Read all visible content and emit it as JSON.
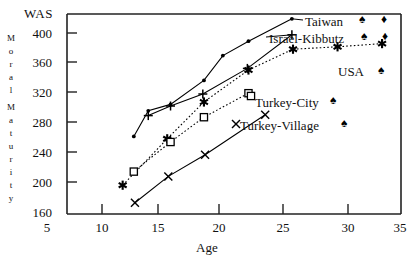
{
  "chart_data": {
    "type": "line",
    "title": "",
    "subtitle": "",
    "xlabel": "Age",
    "ylabel": "Moral Maturity",
    "ylabel_chars": [
      "M",
      "o",
      "r",
      "a",
      "l",
      "M",
      "a",
      "t",
      "u",
      "r",
      "i",
      "t",
      "y"
    ],
    "y_unit_label": "WAS",
    "xlim": [
      5,
      35
    ],
    "ylim": [
      160,
      410
    ],
    "xticks": [
      5,
      10,
      15,
      20,
      25,
      30,
      35
    ],
    "yticks": [
      160,
      200,
      240,
      280,
      320,
      360,
      400
    ],
    "grid": false,
    "legend_position": "inline-right",
    "series": [
      {
        "name": "Taiwan",
        "marker": "dot",
        "line": "solid",
        "color": "#000000",
        "points": [
          {
            "x": 11.0,
            "y": 257
          },
          {
            "x": 12.3,
            "y": 289
          },
          {
            "x": 14.3,
            "y": 297
          },
          {
            "x": 17.3,
            "y": 327
          },
          {
            "x": 19.0,
            "y": 358
          },
          {
            "x": 21.3,
            "y": 376
          },
          {
            "x": 25.2,
            "y": 404
          }
        ]
      },
      {
        "name": "Israel-Kibbutz",
        "marker": "plus",
        "line": "solid",
        "color": "#000000",
        "points": [
          {
            "x": 12.3,
            "y": 283
          },
          {
            "x": 14.3,
            "y": 295
          },
          {
            "x": 17.2,
            "y": 310
          },
          {
            "x": 21.2,
            "y": 342
          },
          {
            "x": 25.2,
            "y": 384
          }
        ]
      },
      {
        "name": "USA",
        "marker": "asterisk",
        "line": "dotted",
        "color": "#000000",
        "points": [
          {
            "x": 10.0,
            "y": 196
          },
          {
            "x": 14.0,
            "y": 254
          },
          {
            "x": 17.3,
            "y": 300
          },
          {
            "x": 21.3,
            "y": 340
          },
          {
            "x": 25.3,
            "y": 366
          },
          {
            "x": 29.3,
            "y": 369
          },
          {
            "x": 33.3,
            "y": 373
          }
        ]
      },
      {
        "name": "Turkey-City",
        "marker": "square",
        "line": "dotted",
        "color": "#000000",
        "points": [
          {
            "x": 11.0,
            "y": 213
          },
          {
            "x": 14.3,
            "y": 250
          },
          {
            "x": 17.3,
            "y": 281
          },
          {
            "x": 21.3,
            "y": 311
          }
        ]
      },
      {
        "name": "Turkey-Village",
        "marker": "cross",
        "line": "solid",
        "color": "#000000",
        "points": [
          {
            "x": 11.1,
            "y": 174
          },
          {
            "x": 14.1,
            "y": 207
          },
          {
            "x": 17.4,
            "y": 234
          },
          {
            "x": 22.8,
            "y": 284
          }
        ]
      }
    ],
    "legend_entries": [
      {
        "label": "Taiwan",
        "marker": "dot"
      },
      {
        "label": "Israel-Kibbutz",
        "marker": "plus"
      },
      {
        "label": "USA",
        "marker": "asterisk"
      },
      {
        "label": "Turkey-City",
        "marker": "square"
      },
      {
        "label": "Turkey-Village",
        "marker": "cross"
      }
    ],
    "scan_artifacts": [
      "♠",
      "♦",
      "♠",
      "♦",
      "♠",
      "♠",
      "♠"
    ]
  }
}
